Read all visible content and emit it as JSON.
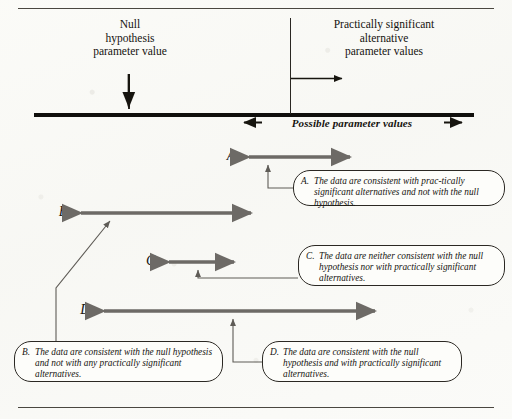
{
  "diagram": {
    "axis": {
      "null_label": "Null\nhypothesis\nparameter value",
      "practical_label": "Practically significant\nalternative\nparameter values",
      "possible_caption": "Possible parameter values",
      "line_color": "#100f0c"
    },
    "arrow_color": "#6d6a66",
    "rows": [
      {
        "letter": "A:",
        "x_start": 243,
        "x_end": 356,
        "y": 157,
        "pointer_x": 268
      },
      {
        "letter": "B:",
        "x_start": 75,
        "x_end": 257,
        "y": 213,
        "pointer_x": 110
      },
      {
        "letter": "C:",
        "x_start": 163,
        "x_end": 240,
        "y": 262,
        "pointer_x": 198
      },
      {
        "letter": "D:",
        "x_start": 98,
        "x_end": 381,
        "y": 311,
        "pointer_x": 233
      }
    ],
    "callouts": [
      {
        "tag": "A.",
        "text": "The data are consistent with prac-tically significant alternatives and not with the null hypothesis.",
        "x": 293,
        "y": 170,
        "width": 212,
        "height": 36
      },
      {
        "tag": "B.",
        "text": "The data are consistent with the null hypothesis and not with any practically significant alternatives.",
        "x": 14,
        "y": 341,
        "width": 209,
        "height": 41
      },
      {
        "tag": "C.",
        "text": "The data are neither consistent with the null hypothesis nor with practically significant alternatives.",
        "x": 298,
        "y": 245,
        "width": 207,
        "height": 41
      },
      {
        "tag": "D.",
        "text": "The data are consistent with the null hypothesis and with practically significant alternatives.",
        "x": 262,
        "y": 341,
        "width": 200,
        "height": 41
      }
    ]
  }
}
